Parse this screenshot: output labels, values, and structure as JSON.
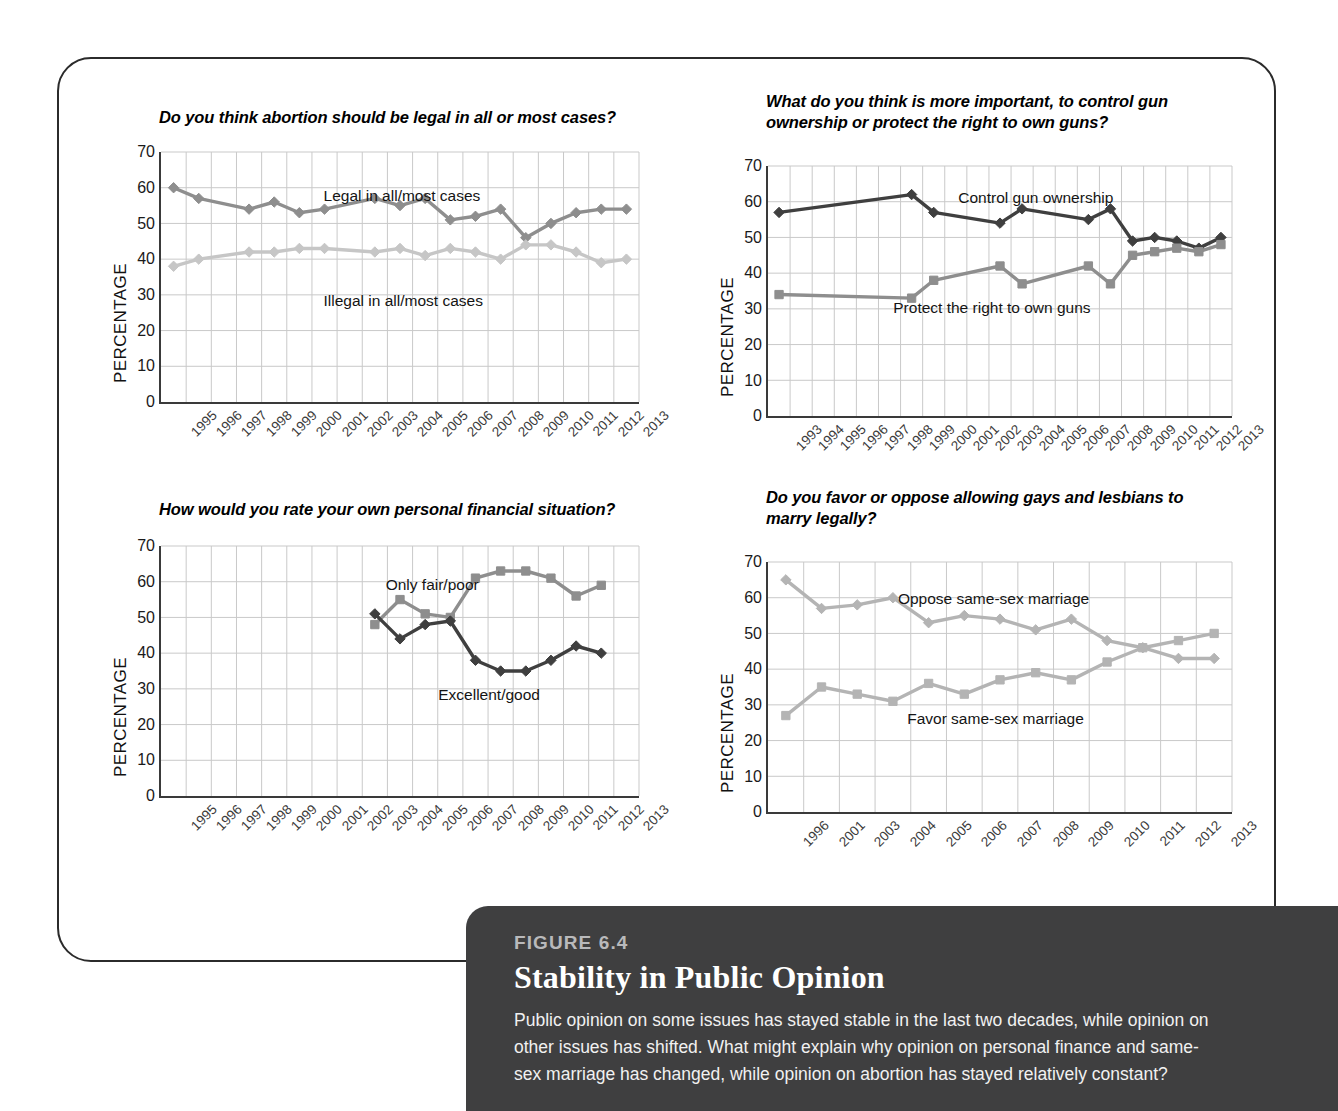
{
  "figure": {
    "number_label": "FIGURE 6.4",
    "title": "Stability in Public Opinion",
    "body": "Public opinion on some issues has stayed stable in the last two decades, while opinion on other issues has shifted. What might explain why opinion on personal finance and same-sex marriage has changed, while opinion on abortion has stayed relatively constant?"
  },
  "axis_label": "PERCENTAGE",
  "colors": {
    "dark": "#3f3f3f",
    "medium": "#8e8e8e",
    "light": "#c6c6c6",
    "grid": "#c9c9c9",
    "axis": "#3a3a3a",
    "caption_bg": "#3f3f40",
    "caption_fignum": "#b9b9bb"
  },
  "chart_data": [
    {
      "id": "abortion",
      "type": "line",
      "title": "Do you think abortion should be legal in all or most cases?",
      "xlabel": "",
      "ylabel": "PERCENTAGE",
      "ylim": [
        0,
        70
      ],
      "yticks": [
        0,
        10,
        20,
        30,
        40,
        50,
        60,
        70
      ],
      "grid": true,
      "legend": "inline-annotations",
      "categories": [
        "1995",
        "1996",
        "1997",
        "1998",
        "1999",
        "2000",
        "2001",
        "2002",
        "2003",
        "2004",
        "2005",
        "2006",
        "2007",
        "2008",
        "2009",
        "2010",
        "2011",
        "2012",
        "2013"
      ],
      "series": [
        {
          "name": "Legal in all/most cases",
          "color": "#8e8e8e",
          "marker": "diamond",
          "values": [
            60,
            57,
            null,
            54,
            56,
            53,
            54,
            null,
            57,
            55,
            57,
            51,
            52,
            54,
            46,
            50,
            53,
            54,
            54
          ]
        },
        {
          "name": "Illegal in all/most cases",
          "color": "#c6c6c6",
          "marker": "diamond",
          "values": [
            38,
            40,
            null,
            42,
            42,
            43,
            43,
            null,
            42,
            43,
            41,
            43,
            42,
            40,
            44,
            44,
            42,
            39,
            40
          ]
        }
      ]
    },
    {
      "id": "guns",
      "type": "line",
      "title": "What do you think is more important, to control gun ownership or protect the right to own guns?",
      "xlabel": "",
      "ylabel": "PERCENTAGE",
      "ylim": [
        0,
        70
      ],
      "yticks": [
        0,
        10,
        20,
        30,
        40,
        50,
        60,
        70
      ],
      "grid": true,
      "legend": "inline-annotations",
      "categories": [
        "1993",
        "1994",
        "1995",
        "1996",
        "1997",
        "1998",
        "1999",
        "2000",
        "2001",
        "2002",
        "2003",
        "2004",
        "2005",
        "2006",
        "2007",
        "2008",
        "2009",
        "2010",
        "2011",
        "2012",
        "2013"
      ],
      "series": [
        {
          "name": "Control gun ownership",
          "color": "#3f3f3f",
          "marker": "diamond",
          "values": [
            57,
            null,
            null,
            null,
            null,
            null,
            62,
            57,
            null,
            null,
            54,
            58,
            null,
            null,
            55,
            58,
            49,
            50,
            49,
            47,
            50
          ]
        },
        {
          "name": "Protect the right to own guns",
          "color": "#8e8e8e",
          "marker": "square",
          "values": [
            34,
            null,
            null,
            null,
            null,
            null,
            33,
            38,
            null,
            null,
            42,
            37,
            null,
            null,
            42,
            37,
            45,
            46,
            47,
            46,
            48
          ]
        }
      ]
    },
    {
      "id": "finance",
      "type": "line",
      "title": "How would you rate your own personal financial situation?",
      "xlabel": "",
      "ylabel": "PERCENTAGE",
      "ylim": [
        0,
        70
      ],
      "yticks": [
        0,
        10,
        20,
        30,
        40,
        50,
        60,
        70
      ],
      "grid": true,
      "legend": "inline-annotations",
      "categories": [
        "1995",
        "1996",
        "1997",
        "1998",
        "1999",
        "2000",
        "2001",
        "2002",
        "2003",
        "2004",
        "2005",
        "2006",
        "2007",
        "2008",
        "2009",
        "2010",
        "2011",
        "2012",
        "2013"
      ],
      "series": [
        {
          "name": "Only fair/poor",
          "color": "#8e8e8e",
          "marker": "square",
          "values": [
            null,
            null,
            null,
            null,
            null,
            null,
            null,
            null,
            48,
            55,
            51,
            50,
            61,
            63,
            63,
            61,
            56,
            59,
            null
          ]
        },
        {
          "name": "Excellent/good",
          "color": "#3f3f3f",
          "marker": "diamond",
          "values": [
            null,
            null,
            null,
            null,
            null,
            null,
            null,
            null,
            51,
            44,
            48,
            49,
            38,
            35,
            35,
            38,
            42,
            40,
            null
          ]
        }
      ]
    },
    {
      "id": "marriage",
      "type": "line",
      "title": "Do you favor or oppose allowing gays and lesbians to marry legally?",
      "xlabel": "",
      "ylabel": "PERCENTAGE",
      "ylim": [
        0,
        70
      ],
      "yticks": [
        0,
        10,
        20,
        30,
        40,
        50,
        60,
        70
      ],
      "grid": true,
      "legend": "inline-annotations",
      "categories": [
        "1996",
        "2001",
        "2003",
        "2004",
        "2005",
        "2006",
        "2007",
        "2008",
        "2009",
        "2010",
        "2011",
        "2012",
        "2013"
      ],
      "series": [
        {
          "name": "Oppose same-sex marriage",
          "color": "#b4b4b4",
          "marker": "diamond",
          "values": [
            65,
            57,
            58,
            60,
            53,
            55,
            54,
            51,
            54,
            48,
            46,
            43,
            43
          ]
        },
        {
          "name": "Favor same-sex marriage",
          "color": "#b4b4b4",
          "marker": "square",
          "values": [
            27,
            35,
            33,
            31,
            36,
            33,
            37,
            39,
            37,
            42,
            46,
            48,
            50
          ]
        }
      ]
    }
  ],
  "annotations": {
    "abortion": [
      {
        "text": "Legal in all/most cases",
        "x_pct": 34,
        "y_pct": 14
      },
      {
        "text": "Illegal in all/most cases",
        "x_pct": 34,
        "y_pct": 56
      }
    ],
    "guns": [
      {
        "text": "Control gun ownership",
        "x_pct": 41,
        "y_pct": 9
      },
      {
        "text": "Protect the right to own guns",
        "x_pct": 27,
        "y_pct": 53
      }
    ],
    "finance": [
      {
        "text": "Only fair/poor",
        "x_pct": 47,
        "y_pct": 12
      },
      {
        "text": "Excellent/good",
        "x_pct": 58,
        "y_pct": 56
      }
    ],
    "marriage": [
      {
        "text": "Oppose same-sex marriage",
        "x_pct": 28,
        "y_pct": 11
      },
      {
        "text": "Favor same-sex marriage",
        "x_pct": 30,
        "y_pct": 59
      }
    ]
  }
}
